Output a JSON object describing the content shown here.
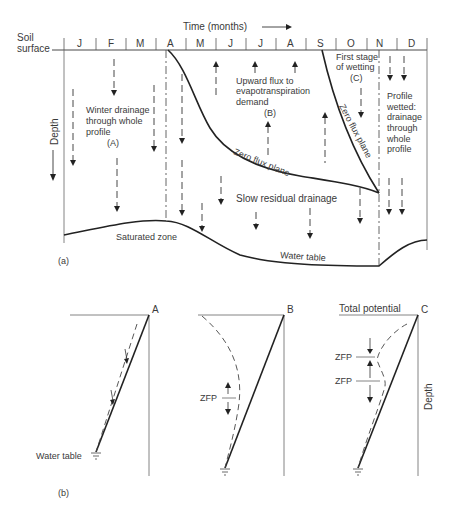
{
  "panel_a": {
    "label": "(a)",
    "time_axis_label": "Time (months)",
    "soil_surface_label_1": "Soil",
    "soil_surface_label_2": "surface",
    "depth_label": "Depth",
    "months": [
      "J",
      "F",
      "M",
      "A",
      "M",
      "J",
      "J",
      "A",
      "S",
      "O",
      "N",
      "D"
    ],
    "regions": {
      "A": {
        "line1": "Winter drainage",
        "line2": "through whole",
        "line3": "profile",
        "tag": "(A)"
      },
      "B": {
        "line1": "Upward flux to",
        "line2": "evapotranspiration",
        "line3": "demand",
        "tag": "(B)"
      },
      "C": {
        "line1": "First stage",
        "line2": "of wetting",
        "tag": "(C)"
      },
      "D": {
        "line1": "Profile",
        "line2": "wetted:",
        "line3": "drainage",
        "line4": "through",
        "line5": "whole",
        "line6": "profile"
      }
    },
    "zero_flux_plane_label_1": "Zero flux plane",
    "zero_flux_plane_label_2": "Zero flux plane",
    "slow_drainage_label": "Slow residual drainage",
    "saturated_zone_label": "Saturated zone",
    "water_table_label": "Water table"
  },
  "panel_b": {
    "label": "(b)",
    "profiles": [
      {
        "id": "A",
        "label": "A"
      },
      {
        "id": "B",
        "label": "B",
        "zfp": "ZFP"
      },
      {
        "id": "C",
        "label": "C",
        "zfp_1": "ZFP",
        "zfp_2": "ZFP"
      }
    ],
    "water_table_label": "Water table",
    "total_potential_label": "Total potential",
    "depth_label": "Depth"
  }
}
